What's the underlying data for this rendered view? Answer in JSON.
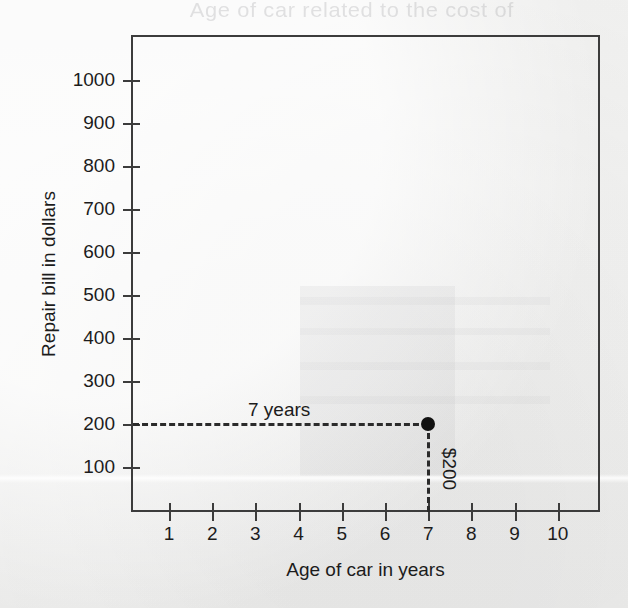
{
  "chart_data": {
    "type": "scatter",
    "title": "",
    "xlabel": "Age of car in years",
    "ylabel": "Repair bill in dollars",
    "xlim": [
      0,
      11
    ],
    "ylim": [
      0,
      1100
    ],
    "x_ticks": [
      "1",
      "2",
      "3",
      "4",
      "5",
      "6",
      "7",
      "8",
      "9",
      "10"
    ],
    "y_ticks": [
      "1000",
      "900",
      "800",
      "700",
      "600",
      "500",
      "400",
      "300",
      "200",
      "100"
    ],
    "grid": false,
    "legend": "none",
    "points": [
      {
        "x": 7,
        "y": 200,
        "label": "plotted-point"
      }
    ],
    "annotations": {
      "horizontal_guide_label": "7 years",
      "vertical_guide_label": "$200"
    }
  },
  "colors": {
    "axis": "#3c3c3c",
    "text": "#1c1c1c",
    "point": "#111111",
    "guide": "#2b2b2b",
    "background": "#f3f3f2"
  },
  "artifacts": {
    "bleed_through_text": "Age of car related to the cost of"
  }
}
